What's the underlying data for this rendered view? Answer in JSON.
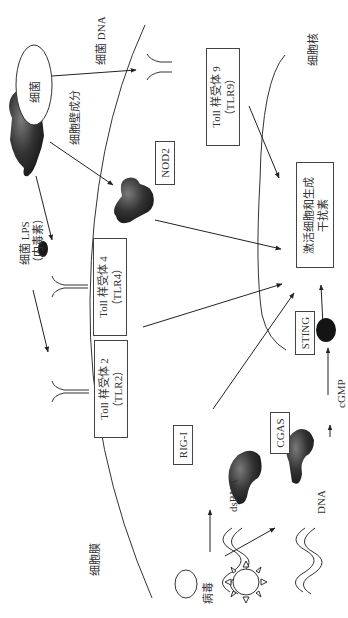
{
  "diagram": {
    "orientation": "rotated 90 degrees counter-clockwise",
    "labels": {
      "bacteria": "细菌",
      "bacterial_dna": "细菌 DNA",
      "cell_wall_components": "细胞壁成分",
      "bacterial_lps_line1": "细菌 LPS",
      "bacterial_lps_line2": "（内毒素）",
      "cell_membrane": "细胞膜",
      "nucleus": "细胞核",
      "virus": "病毒",
      "dsrna": "dsRNA",
      "dna": "DNA",
      "cgmp": "cGMP"
    },
    "boxes": {
      "tlr9_line1": "Toll 样受体 9",
      "tlr9_line2": "（TLR9）",
      "tlr4_line1": "Toll 样受体 4",
      "tlr4_line2": "（TLR4）",
      "tlr2_line1": "Toll 样受体 2",
      "tlr2_line2": "（TLR2）",
      "nod2": "NOD2",
      "rig_i": "RIG-I",
      "cgas": "CGAS",
      "sting": "STING",
      "outcome_line1": "激活细胞和生成",
      "outcome_line2": "干扰素"
    },
    "colors": {
      "line": "#333333",
      "protein_dark": "#2a2a2a",
      "protein_mid": "#6a6a6a",
      "background": "#ffffff"
    }
  }
}
